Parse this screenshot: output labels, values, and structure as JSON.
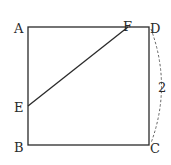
{
  "diagram": {
    "type": "geometry-square",
    "points": {
      "A": {
        "label": "A",
        "x": 28,
        "y": 27
      },
      "B": {
        "label": "B",
        "x": 28,
        "y": 145
      },
      "C": {
        "label": "C",
        "x": 149,
        "y": 145
      },
      "D": {
        "label": "D",
        "x": 149,
        "y": 27
      },
      "E": {
        "label": "E",
        "x": 28,
        "y": 106
      },
      "F": {
        "label": "F",
        "x": 128,
        "y": 27
      }
    },
    "segments": [
      "AB",
      "BC",
      "CD",
      "DA",
      "EF"
    ],
    "measure": {
      "side": "DC",
      "label": "2",
      "style": "dashed-arc"
    },
    "line_color": "#2a2a2a"
  }
}
